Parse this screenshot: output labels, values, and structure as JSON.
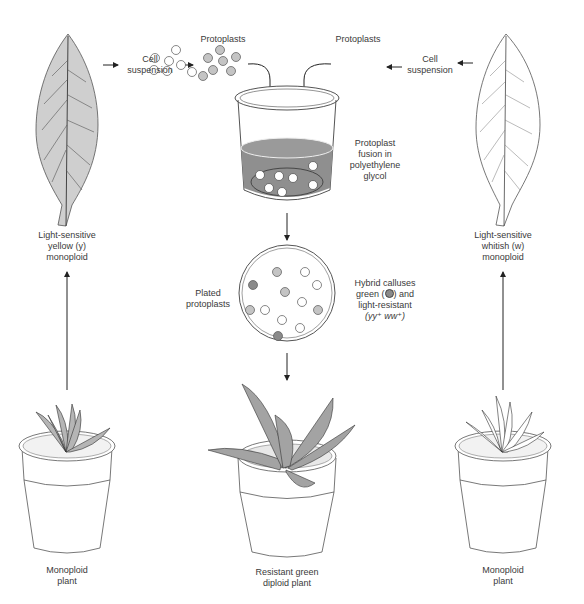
{
  "diagram": {
    "left_column": {
      "leaf_label": [
        "Light-sensitive",
        "yellow (y)",
        "monoploid"
      ],
      "plant_label": [
        "Monoploid",
        "plant"
      ],
      "cell_suspension": [
        "Cell",
        "suspension"
      ],
      "protoplasts": "Protoplasts",
      "leaf_fill": "#cfcfcf"
    },
    "right_column": {
      "leaf_label": [
        "Light-sensitive",
        "whitish (w)",
        "monoploid"
      ],
      "plant_label": [
        "Monoploid",
        "plant"
      ],
      "cell_suspension": [
        "Cell",
        "suspension"
      ],
      "protoplasts": "Protoplasts",
      "leaf_fill": "#ffffff"
    },
    "center": {
      "beaker_label": [
        "Protoplast",
        "fusion in",
        "polyethylene",
        "glycol"
      ],
      "plate_left_label": [
        "Plated",
        "protoplasts"
      ],
      "plate_right_label": [
        "Hybrid calluses",
        "green (",
        ") and",
        "light-resistant",
        "(yy⁺ ww⁺)"
      ],
      "result_label": [
        "Resistant green",
        "diploid plant"
      ],
      "liquid_color": "#8f8f8f",
      "green_callus_color": "#8a8a8a",
      "yellow_cell_color": "#c4c4c4"
    }
  }
}
